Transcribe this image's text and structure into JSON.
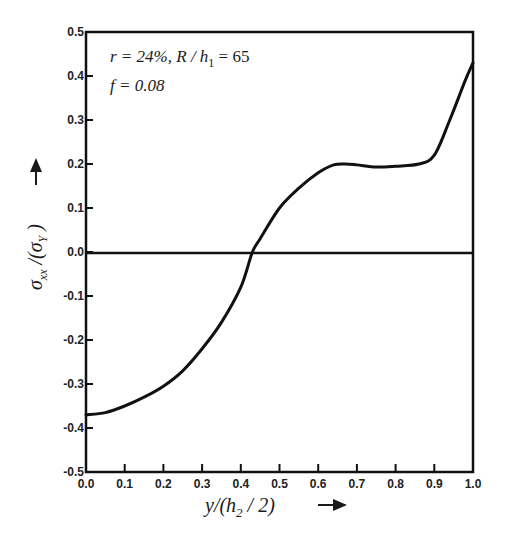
{
  "chart_data": {
    "type": "line",
    "title": "",
    "xlabel": "y/(h2/2) →",
    "ylabel": "σxx/(σY) →",
    "xlim": [
      0.0,
      1.0
    ],
    "ylim": [
      -0.5,
      0.5
    ],
    "grid": false,
    "legend": null,
    "x_ticks": [
      "0.0",
      "0.1",
      "0.2",
      "0.3",
      "0.4",
      "0.5",
      "0.6",
      "0.7",
      "0.8",
      "0.9",
      "1.0"
    ],
    "y_ticks": [
      "0.5",
      "0.4",
      "0.3",
      "0.2",
      "0.1",
      "0.0",
      "-0.1",
      "-0.2",
      "-0.3",
      "-0.4",
      "-0.5"
    ],
    "annotations": [
      "r = 24%, R / h1 = 65",
      "f = 0.08"
    ],
    "reference_lines": [
      {
        "axis": "y",
        "value": 0.0
      }
    ],
    "series": [
      {
        "name": "σxx/σY",
        "x": [
          0.0,
          0.05,
          0.1,
          0.15,
          0.2,
          0.25,
          0.3,
          0.35,
          0.4,
          0.43,
          0.45,
          0.5,
          0.55,
          0.6,
          0.64,
          0.67,
          0.7,
          0.75,
          0.8,
          0.86,
          0.9,
          0.94,
          0.98,
          1.0
        ],
        "y": [
          -0.37,
          -0.365,
          -0.35,
          -0.33,
          -0.305,
          -0.27,
          -0.22,
          -0.16,
          -0.08,
          0.0,
          0.03,
          0.1,
          0.145,
          0.18,
          0.198,
          0.2,
          0.198,
          0.193,
          0.195,
          0.2,
          0.22,
          0.3,
          0.39,
          0.43
        ]
      }
    ]
  },
  "labels": {
    "annotation_line1_r": "r = 24%, R / h",
    "annotation_line1_sub": "1",
    "annotation_line1_rest": " = 65",
    "annotation_line2": "f = 0.08",
    "xlabel_main": "y/(h",
    "xlabel_sub": "2",
    "xlabel_tail": " / 2)",
    "ylabel_main": "σ",
    "ylabel_sub": "xx",
    "ylabel_mid": " /(σ",
    "ylabel_sub2": "Y",
    "ylabel_tail": " )"
  }
}
